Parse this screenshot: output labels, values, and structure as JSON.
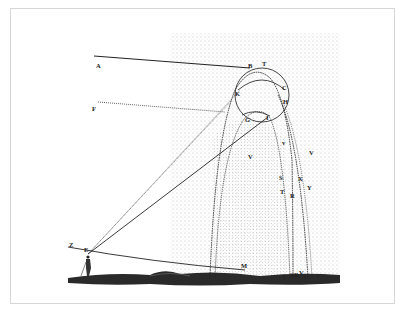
{
  "figure": {
    "colors": {
      "ink": "#222222",
      "frame": "#d6d6d6",
      "background": "#ffffff"
    },
    "labels": {
      "A": "A",
      "B": "B",
      "T_top": "T",
      "C": "C",
      "K": "K",
      "H": "H",
      "F": "F",
      "G": "G",
      "I": "I",
      "V_inner": "V",
      "V_small": "v",
      "V_right": "V",
      "S": "S",
      "T_mid": "T",
      "R": "R",
      "X": "X",
      "Y_mid": "Y",
      "Z": "Z",
      "E": "E",
      "M": "M",
      "T_ground": "T",
      "S_ground": "S",
      "R_ground": "R",
      "V_ground": "V",
      "X_ground": "x",
      "Y_ground": "Y"
    }
  }
}
